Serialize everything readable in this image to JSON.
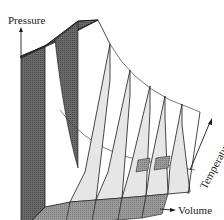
{
  "diagram": {
    "axes": {
      "pressure": "Pressure",
      "volume": "Volume",
      "temperature": "Temperature"
    },
    "colors": {
      "dark_fill": "#5a5a5a",
      "medium_fill": "#8c8c8c",
      "light_fill": "#e6e6e6",
      "line": "#1a1a1a",
      "background": "#ffffff"
    },
    "slice_count": 5
  }
}
